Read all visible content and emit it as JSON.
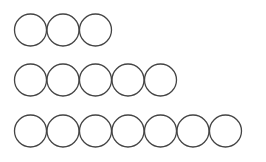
{
  "diagram": {
    "type": "circle-rows",
    "stroke_color": "#444444",
    "background": "#ffffff",
    "circle_diameter": 33,
    "circle_step": 32.5,
    "start_x": 14,
    "rows": [
      {
        "count": 3,
        "center_y": 30
      },
      {
        "count": 5,
        "center_y": 80
      },
      {
        "count": 7,
        "center_y": 131
      }
    ]
  }
}
